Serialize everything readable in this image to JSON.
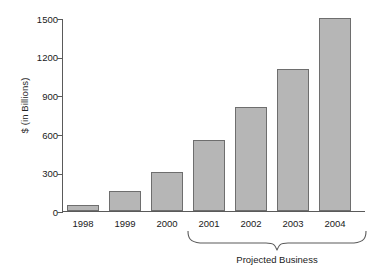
{
  "chart_data": {
    "type": "bar",
    "title": "",
    "subtitle": "",
    "xlabel": "",
    "ylabel": "$ (in Billions)",
    "categories": [
      "1998",
      "1999",
      "2000",
      "2001",
      "2002",
      "2003",
      "2004"
    ],
    "values": [
      50,
      155,
      305,
      550,
      805,
      1100,
      1500
    ],
    "ylim": [
      0,
      1500
    ],
    "yticks": [
      0,
      300,
      600,
      900,
      1200,
      1500
    ],
    "ytick_labels": [
      "0",
      "300",
      "600",
      "900",
      "1200",
      "1500"
    ],
    "grid": false,
    "legend": null,
    "legend_position": "none",
    "annotations": [
      {
        "text": "Projected Business",
        "spans_categories": [
          "2001",
          "2002",
          "2003",
          "2004"
        ],
        "marker": "curly-brace-below-axis"
      }
    ],
    "series": [
      {
        "name": "Business",
        "values": [
          50,
          155,
          305,
          550,
          805,
          1100,
          1500
        ]
      }
    ]
  },
  "style": {
    "bar_fill": "#b6b6b6",
    "bar_stroke": "#6e6e6e",
    "axis_color": "#5a5a5a",
    "text_color": "#1a1a1a",
    "background": "#ffffff"
  },
  "annotation": {
    "projected_label": "Projected Business"
  }
}
